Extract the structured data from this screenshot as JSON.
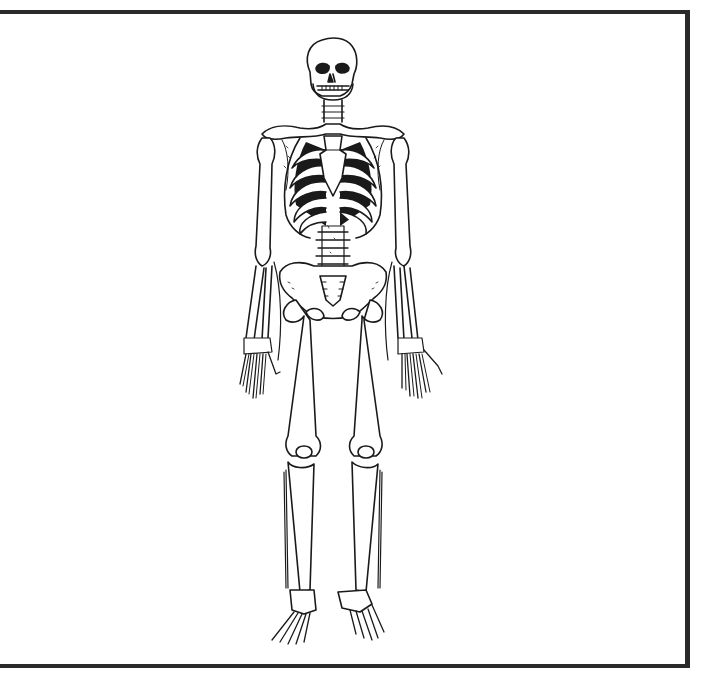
{
  "image": {
    "subject": "Human skeleton, anterior view, line drawing",
    "alt": "Black-and-white line illustration of a full human skeleton standing, front view, inside a frame bordered on the top, right and bottom",
    "colors": {
      "background": "#ffffff",
      "frame": "#2a2a2a",
      "ink": "#1a1a1a"
    },
    "frame": {
      "sides": [
        "top",
        "right",
        "bottom"
      ]
    },
    "parts": [
      "skull",
      "mandible",
      "cervical-spine",
      "clavicles",
      "scapulae",
      "sternum",
      "rib-cage",
      "humerus-left",
      "humerus-right",
      "radius-ulna-left",
      "radius-ulna-right",
      "hand-left",
      "hand-right",
      "lumbar-spine",
      "pelvis",
      "sacrum",
      "femur-left",
      "femur-right",
      "patella-left",
      "patella-right",
      "tibia-fibula-left",
      "tibia-fibula-right",
      "foot-left",
      "foot-right"
    ]
  }
}
